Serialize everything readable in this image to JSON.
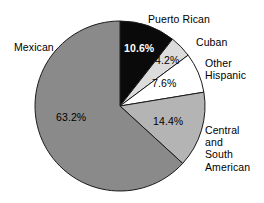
{
  "chart_data": {
    "type": "pie",
    "title": "",
    "subtitle": "",
    "xlabel": "",
    "ylabel": "",
    "legend_position": "none",
    "grid": false,
    "units": "percent",
    "categories": [
      "Puerto Rican",
      "Cuban",
      "Other Hispanic",
      "Central and South American",
      "Mexican"
    ],
    "values": [
      10.6,
      4.2,
      7.6,
      14.4,
      63.2
    ],
    "value_labels": [
      "10.6%",
      "4.2%",
      "7.6%",
      "14.4%",
      "63.2%"
    ],
    "start_angle_deg": 0,
    "direction": "clockwise",
    "slices": [
      {
        "name": "puerto-rican",
        "label": "Puerto Rican",
        "label_lines": [
          "Puerto Rican"
        ],
        "value": 10.6,
        "value_label": "10.6%",
        "color": "#0a0a0a",
        "label_color": "#000000",
        "value_text_color": "#ffffff",
        "value_text_bold": true
      },
      {
        "name": "cuban",
        "label": "Cuban",
        "label_lines": [
          "Cuban"
        ],
        "value": 4.2,
        "value_label": "4.2%",
        "color": "#dcdcdc",
        "label_color": "#000000",
        "value_text_color": "#000000",
        "value_text_bold": false
      },
      {
        "name": "other-hispanic",
        "label": "Other Hispanic",
        "label_lines": [
          "Other",
          "Hispanic"
        ],
        "value": 7.6,
        "value_label": "7.6%",
        "color": "#ffffff",
        "label_color": "#000000",
        "value_text_color": "#000000",
        "value_text_bold": false
      },
      {
        "name": "central-and-south-american",
        "label": "Central and South American",
        "label_lines": [
          "Central",
          "and",
          "South",
          "American"
        ],
        "value": 14.4,
        "value_label": "14.4%",
        "color": "#b4b4b4",
        "label_color": "#000000",
        "value_text_color": "#000000",
        "value_text_bold": false
      },
      {
        "name": "mexican",
        "label": "Mexican",
        "label_lines": [
          "Mexican"
        ],
        "value": 63.2,
        "value_label": "63.2%",
        "color": "#8a8a8a",
        "label_color": "#000000",
        "value_text_color": "#000000",
        "value_text_bold": false
      }
    ],
    "geometry": {
      "center_x": 120,
      "center_y": 106,
      "radius": 85,
      "outline_color": "#1a1a1a",
      "outline_width": 1
    },
    "background_color": "#ffffff"
  },
  "labels": {
    "mexican": "Mexican",
    "puerto_rican": "Puerto Rican",
    "cuban": "Cuban",
    "other_hispanic_line1": "Other",
    "other_hispanic_line2": "Hispanic",
    "central_line1": "Central",
    "central_line2": "and",
    "central_line3": "South",
    "central_line4": "American"
  },
  "percentages": {
    "mexican": "63.2%",
    "puerto_rican": "10.6%",
    "cuban": "4.2%",
    "other_hispanic": "7.6%",
    "central_south_american": "14.4%"
  }
}
